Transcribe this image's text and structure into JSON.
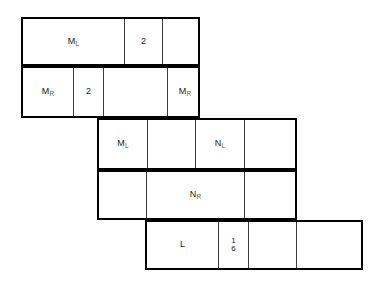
{
  "figure": {
    "line_color": "#000000",
    "thin_line_color": "#3a3a3a",
    "background": "#ffffff"
  },
  "rows": [
    {
      "id": "row-1",
      "x": 21,
      "y": 17,
      "width": 179,
      "height": 49,
      "cells": [
        {
          "id": "r1c1",
          "x": 0,
          "width": 102,
          "label": "M",
          "sub": "L",
          "divider": true
        },
        {
          "id": "r1c2",
          "x": 102,
          "width": 38,
          "label": "2",
          "sub": "",
          "divider": true
        },
        {
          "id": "r1c3",
          "x": 140,
          "width": 39,
          "label": "",
          "sub": "",
          "divider": false
        }
      ]
    },
    {
      "id": "row-2",
      "x": 21,
      "y": 66,
      "width": 179,
      "height": 52,
      "cells": [
        {
          "id": "r2c1",
          "x": 0,
          "width": 51,
          "label": "M",
          "sub": "R",
          "divider": true
        },
        {
          "id": "r2c2",
          "x": 51,
          "width": 30,
          "label": "2",
          "sub": "",
          "divider": true
        },
        {
          "id": "r2c3",
          "x": 81,
          "width": 64,
          "label": "",
          "sub": "",
          "divider": true
        },
        {
          "id": "r2c4",
          "x": 145,
          "width": 34,
          "label": "M",
          "sub": "R",
          "divider": false
        }
      ]
    },
    {
      "id": "row-3",
      "x": 97,
      "y": 118,
      "width": 200,
      "height": 52,
      "cells": [
        {
          "id": "r3c1",
          "x": 0,
          "width": 49,
          "label": "M",
          "sub": "L",
          "divider": true
        },
        {
          "id": "r3c2",
          "x": 49,
          "width": 48,
          "label": "",
          "sub": "",
          "divider": true
        },
        {
          "id": "r3c3",
          "x": 97,
          "width": 49,
          "label": "N",
          "sub": "L",
          "divider": true
        },
        {
          "id": "r3c4",
          "x": 146,
          "width": 54,
          "label": "",
          "sub": "",
          "divider": false
        }
      ]
    },
    {
      "id": "row-4",
      "x": 97,
      "y": 170,
      "width": 200,
      "height": 50,
      "cells": [
        {
          "id": "r4c1",
          "x": 0,
          "width": 48,
          "label": "",
          "sub": "",
          "divider": true
        },
        {
          "id": "r4c2",
          "x": 48,
          "width": 98,
          "label": "N",
          "sub": "R",
          "divider": true
        },
        {
          "id": "r4c3",
          "x": 146,
          "width": 54,
          "label": "",
          "sub": "",
          "divider": false
        }
      ]
    },
    {
      "id": "row-5",
      "x": 145,
      "y": 220,
      "width": 218,
      "height": 50,
      "cells": [
        {
          "id": "r5c1",
          "x": 0,
          "width": 72,
          "label": "L",
          "sub": "",
          "divider": true
        },
        {
          "id": "r5c2",
          "x": 72,
          "width": 30,
          "label": "",
          "sub": "",
          "divider": true,
          "fraction": {
            "numerator": "1",
            "denominator": "6"
          }
        },
        {
          "id": "r5c3",
          "x": 102,
          "width": 48,
          "label": "",
          "sub": "",
          "divider": true
        },
        {
          "id": "r5c4",
          "x": 150,
          "width": 68,
          "label": "",
          "sub": "",
          "divider": false
        }
      ]
    }
  ]
}
